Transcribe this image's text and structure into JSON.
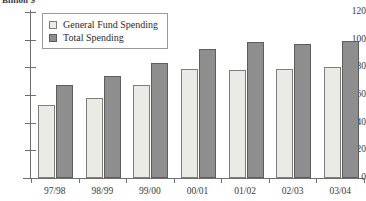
{
  "chart_data": {
    "type": "bar",
    "title": "",
    "subtitle": "",
    "xlabel": "",
    "ylabel": "Billion $",
    "categories": [
      "97/98",
      "98/99",
      "99/00",
      "00/01",
      "01/02",
      "02/03",
      "03/04"
    ],
    "series": [
      {
        "name": "General Fund Spending",
        "color": "#ebebe6",
        "values": [
          53,
          58,
          67,
          79,
          78,
          79,
          80
        ]
      },
      {
        "name": "Total Spending",
        "color": "#8e8e8e",
        "values": [
          67,
          74,
          83,
          93,
          98,
          97,
          99
        ]
      }
    ],
    "ylim": [
      0,
      120
    ],
    "yticks": [
      0,
      20,
      40,
      60,
      80,
      100,
      120
    ],
    "ytick_labels": [
      "0",
      "20",
      "40",
      "60",
      "80",
      "100",
      "120"
    ],
    "grid": false,
    "legend_position": "top-left"
  },
  "legend": {
    "items": [
      {
        "label": "General Fund Spending",
        "swatch": "general"
      },
      {
        "label": "Total Spending",
        "swatch": "total"
      }
    ]
  }
}
